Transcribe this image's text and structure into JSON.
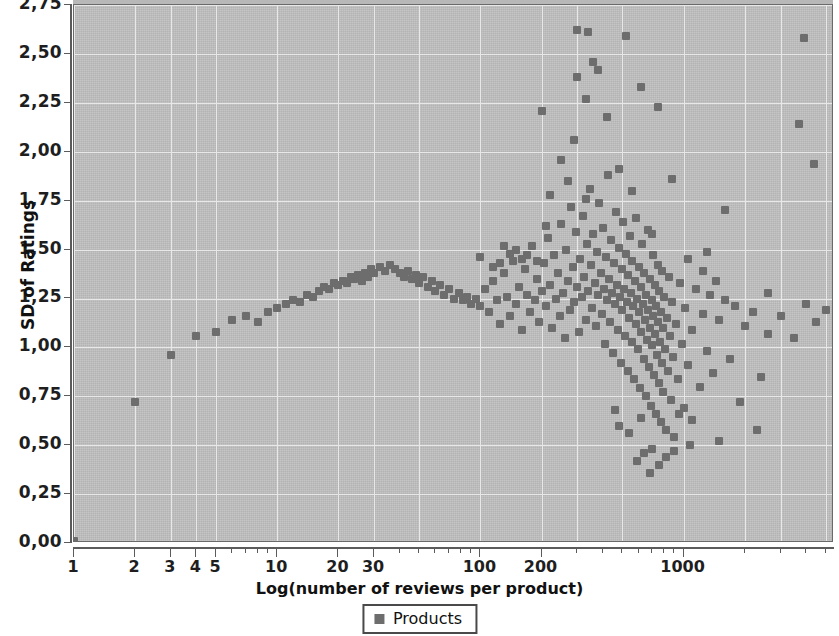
{
  "chart_data": {
    "type": "scatter",
    "title": "",
    "xlabel": "Log(number of reviews per product)",
    "ylabel": "SD of Ratings",
    "xscale": "log",
    "yscale": "linear",
    "xlim": [
      1,
      5500
    ],
    "ylim": [
      0.0,
      2.75
    ],
    "grid": true,
    "legend_position": "bottom-center",
    "x_tick_labels": [
      "1",
      "2",
      "3",
      "4",
      "5",
      "10",
      "20",
      "30",
      "100",
      "200",
      "1000"
    ],
    "x_tick_values": [
      1,
      2,
      3,
      4,
      5,
      10,
      20,
      30,
      100,
      200,
      1000
    ],
    "y_tick_labels": [
      "0,00",
      "0,25",
      "0,50",
      "0,75",
      "1,00",
      "1,25",
      "1,50",
      "1,75",
      "2,00",
      "2,25",
      "2,50",
      "2,75"
    ],
    "y_tick_values": [
      0.0,
      0.25,
      0.5,
      0.75,
      1.0,
      1.25,
      1.5,
      1.75,
      2.0,
      2.25,
      2.5,
      2.75
    ],
    "marker_color": "#6d6d6d",
    "plot_background": "#bfbfbf",
    "gridline_color": "#e8e8e8",
    "series": [
      {
        "name": "Products",
        "marker": "square",
        "color": "#6d6d6d",
        "points": [
          [
            1,
            0.01
          ],
          [
            2,
            0.72
          ],
          [
            3,
            0.96
          ],
          [
            4,
            1.06
          ],
          [
            5,
            1.08
          ],
          [
            6,
            1.14
          ],
          [
            7,
            1.16
          ],
          [
            8,
            1.13
          ],
          [
            9,
            1.18
          ],
          [
            10,
            1.2
          ],
          [
            11,
            1.22
          ],
          [
            12,
            1.24
          ],
          [
            13,
            1.23
          ],
          [
            14,
            1.27
          ],
          [
            15,
            1.26
          ],
          [
            16,
            1.29
          ],
          [
            17,
            1.31
          ],
          [
            18,
            1.3
          ],
          [
            19,
            1.33
          ],
          [
            20,
            1.32
          ],
          [
            21,
            1.34
          ],
          [
            22,
            1.33
          ],
          [
            23,
            1.36
          ],
          [
            24,
            1.35
          ],
          [
            25,
            1.37
          ],
          [
            26,
            1.34
          ],
          [
            27,
            1.38
          ],
          [
            28,
            1.36
          ],
          [
            29,
            1.4
          ],
          [
            30,
            1.38
          ],
          [
            32,
            1.41
          ],
          [
            34,
            1.39
          ],
          [
            36,
            1.42
          ],
          [
            38,
            1.4
          ],
          [
            40,
            1.38
          ],
          [
            42,
            1.36
          ],
          [
            44,
            1.39
          ],
          [
            46,
            1.35
          ],
          [
            48,
            1.37
          ],
          [
            50,
            1.33
          ],
          [
            52,
            1.36
          ],
          [
            55,
            1.31
          ],
          [
            58,
            1.34
          ],
          [
            60,
            1.29
          ],
          [
            63,
            1.32
          ],
          [
            66,
            1.27
          ],
          [
            70,
            1.3
          ],
          [
            74,
            1.25
          ],
          [
            78,
            1.28
          ],
          [
            82,
            1.24
          ],
          [
            86,
            1.26
          ],
          [
            90,
            1.22
          ],
          [
            95,
            1.25
          ],
          [
            100,
            1.21
          ],
          [
            100,
            1.46
          ],
          [
            105,
            1.3
          ],
          [
            110,
            1.18
          ],
          [
            115,
            1.34
          ],
          [
            120,
            1.24
          ],
          [
            125,
            1.12
          ],
          [
            130,
            1.38
          ],
          [
            135,
            1.26
          ],
          [
            140,
            1.16
          ],
          [
            145,
            1.44
          ],
          [
            150,
            1.22
          ],
          [
            155,
            1.31
          ],
          [
            160,
            1.09
          ],
          [
            165,
            1.4
          ],
          [
            170,
            1.27
          ],
          [
            175,
            1.18
          ],
          [
            180,
            1.52
          ],
          [
            185,
            1.24
          ],
          [
            190,
            1.35
          ],
          [
            195,
            1.13
          ],
          [
            200,
            1.29
          ],
          [
            200,
            2.21
          ],
          [
            205,
            1.43
          ],
          [
            210,
            1.21
          ],
          [
            215,
            1.56
          ],
          [
            220,
            1.32
          ],
          [
            225,
            1.1
          ],
          [
            230,
            1.47
          ],
          [
            235,
            1.25
          ],
          [
            240,
            1.38
          ],
          [
            245,
            1.16
          ],
          [
            250,
            1.63
          ],
          [
            255,
            1.28
          ],
          [
            260,
            1.05
          ],
          [
            265,
            1.5
          ],
          [
            270,
            1.34
          ],
          [
            275,
            1.19
          ],
          [
            280,
            1.72
          ],
          [
            285,
            1.41
          ],
          [
            290,
            1.23
          ],
          [
            295,
            1.59
          ],
          [
            300,
            1.31
          ],
          [
            305,
            1.08
          ],
          [
            310,
            1.45
          ],
          [
            315,
            1.26
          ],
          [
            320,
            1.67
          ],
          [
            325,
            1.36
          ],
          [
            330,
            1.14
          ],
          [
            335,
            1.53
          ],
          [
            340,
            1.29
          ],
          [
            345,
            1.81
          ],
          [
            350,
            1.42
          ],
          [
            355,
            1.2
          ],
          [
            360,
            1.58
          ],
          [
            365,
            1.33
          ],
          [
            370,
            1.11
          ],
          [
            375,
            1.49
          ],
          [
            380,
            1.27
          ],
          [
            385,
            1.74
          ],
          [
            390,
            1.38
          ],
          [
            395,
            1.17
          ],
          [
            400,
            1.61
          ],
          [
            405,
            1.3
          ],
          [
            410,
            1.02
          ],
          [
            415,
            1.46
          ],
          [
            420,
            1.24
          ],
          [
            425,
            1.88
          ],
          [
            430,
            1.35
          ],
          [
            435,
            1.13
          ],
          [
            440,
            1.55
          ],
          [
            445,
            1.28
          ],
          [
            450,
            0.97
          ],
          [
            455,
            1.43
          ],
          [
            460,
            1.22
          ],
          [
            465,
            1.69
          ],
          [
            470,
            1.32
          ],
          [
            475,
            1.09
          ],
          [
            480,
            1.51
          ],
          [
            485,
            1.26
          ],
          [
            490,
            0.92
          ],
          [
            495,
            1.4
          ],
          [
            500,
            1.19
          ],
          [
            505,
            1.64
          ],
          [
            510,
            1.3
          ],
          [
            515,
            1.06
          ],
          [
            520,
            1.48
          ],
          [
            525,
            1.23
          ],
          [
            530,
            0.88
          ],
          [
            535,
            1.37
          ],
          [
            540,
            1.15
          ],
          [
            545,
            1.57
          ],
          [
            550,
            1.28
          ],
          [
            555,
            1.03
          ],
          [
            560,
            1.44
          ],
          [
            565,
            1.21
          ],
          [
            570,
            0.84
          ],
          [
            575,
            1.34
          ],
          [
            580,
            1.12
          ],
          [
            585,
            1.66
          ],
          [
            590,
            1.25
          ],
          [
            595,
            0.99
          ],
          [
            600,
            1.41
          ],
          [
            605,
            1.18
          ],
          [
            610,
            0.79
          ],
          [
            615,
            1.31
          ],
          [
            620,
            1.08
          ],
          [
            625,
            1.53
          ],
          [
            630,
            1.22
          ],
          [
            635,
            0.94
          ],
          [
            640,
            1.38
          ],
          [
            645,
            1.14
          ],
          [
            650,
            0.75
          ],
          [
            655,
            1.27
          ],
          [
            660,
            1.04
          ],
          [
            665,
            1.6
          ],
          [
            670,
            1.19
          ],
          [
            675,
            0.9
          ],
          [
            680,
            1.35
          ],
          [
            685,
            1.1
          ],
          [
            690,
            0.7
          ],
          [
            695,
            1.24
          ],
          [
            700,
            1.01
          ],
          [
            705,
            1.47
          ],
          [
            710,
            1.16
          ],
          [
            715,
            0.86
          ],
          [
            720,
            1.32
          ],
          [
            725,
            1.07
          ],
          [
            730,
            0.66
          ],
          [
            735,
            1.21
          ],
          [
            740,
            0.96
          ],
          [
            745,
            1.42
          ],
          [
            750,
            1.13
          ],
          [
            755,
            0.82
          ],
          [
            760,
            1.29
          ],
          [
            765,
            1.03
          ],
          [
            770,
            0.62
          ],
          [
            775,
            1.18
          ],
          [
            780,
            0.92
          ],
          [
            785,
            1.39
          ],
          [
            790,
            1.1
          ],
          [
            795,
            0.77
          ],
          [
            800,
            1.26
          ],
          [
            810,
            0.99
          ],
          [
            820,
            0.58
          ],
          [
            830,
            1.15
          ],
          [
            840,
            0.88
          ],
          [
            850,
            1.36
          ],
          [
            860,
            1.06
          ],
          [
            870,
            0.73
          ],
          [
            880,
            1.23
          ],
          [
            890,
            0.95
          ],
          [
            900,
            0.54
          ],
          [
            920,
            1.12
          ],
          [
            940,
            0.84
          ],
          [
            960,
            1.33
          ],
          [
            980,
            1.02
          ],
          [
            1000,
            0.69
          ],
          [
            1020,
            1.2
          ],
          [
            1050,
            0.91
          ],
          [
            1080,
            0.5
          ],
          [
            1100,
            1.09
          ],
          [
            1150,
            1.3
          ],
          [
            1200,
            0.8
          ],
          [
            1250,
            1.17
          ],
          [
            1300,
            0.98
          ],
          [
            1350,
            1.27
          ],
          [
            1400,
            0.87
          ],
          [
            1500,
            1.14
          ],
          [
            1600,
            1.24
          ],
          [
            1700,
            0.94
          ],
          [
            1800,
            1.21
          ],
          [
            2000,
            1.11
          ],
          [
            2200,
            1.18
          ],
          [
            2400,
            0.85
          ],
          [
            2600,
            1.07
          ],
          [
            3000,
            1.16
          ],
          [
            3500,
            1.05
          ],
          [
            4000,
            1.22
          ],
          [
            4500,
            1.13
          ],
          [
            5000,
            1.19
          ],
          [
            300,
            2.62
          ],
          [
            340,
            2.61
          ],
          [
            520,
            2.59
          ],
          [
            3900,
            2.58
          ],
          [
            300,
            2.38
          ],
          [
            360,
            2.46
          ],
          [
            380,
            2.42
          ],
          [
            620,
            2.33
          ],
          [
            330,
            2.27
          ],
          [
            420,
            2.18
          ],
          [
            750,
            2.23
          ],
          [
            3700,
            2.14
          ],
          [
            250,
            1.96
          ],
          [
            290,
            2.06
          ],
          [
            480,
            1.91
          ],
          [
            880,
            1.86
          ],
          [
            4400,
            1.94
          ],
          [
            220,
            1.78
          ],
          [
            270,
            1.85
          ],
          [
            560,
            1.8
          ],
          [
            1600,
            1.7
          ],
          [
            210,
            1.62
          ],
          [
            330,
            1.76
          ],
          [
            700,
            1.58
          ],
          [
            1300,
            1.49
          ],
          [
            640,
            0.46
          ],
          [
            700,
            0.48
          ],
          [
            820,
            0.44
          ],
          [
            900,
            0.47
          ],
          [
            590,
            0.42
          ],
          [
            760,
            0.4
          ],
          [
            680,
            0.36
          ],
          [
            1500,
            0.52
          ],
          [
            480,
            0.6
          ],
          [
            540,
            0.56
          ],
          [
            1100,
            0.63
          ],
          [
            2300,
            0.58
          ],
          [
            460,
            0.68
          ],
          [
            620,
            0.64
          ],
          [
            950,
            0.66
          ],
          [
            1900,
            0.72
          ],
          [
            1050,
            1.45
          ],
          [
            1250,
            1.39
          ],
          [
            1450,
            1.34
          ],
          [
            2600,
            1.28
          ],
          [
            150,
            1.5
          ],
          [
            170,
            1.47
          ],
          [
            190,
            1.44
          ],
          [
            130,
            1.52
          ],
          [
            115,
            1.41
          ],
          [
            125,
            1.43
          ],
          [
            140,
            1.48
          ],
          [
            160,
            1.45
          ]
        ]
      }
    ]
  },
  "legend": {
    "items": [
      {
        "label": "Products",
        "color": "#6d6d6d"
      }
    ]
  }
}
